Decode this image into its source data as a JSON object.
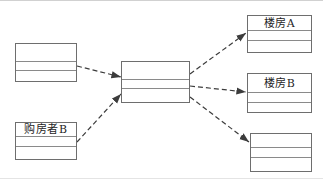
{
  "diagram": {
    "nodes": {
      "left_top": {
        "label": ""
      },
      "left_bottom": {
        "label": "购房者B"
      },
      "middle": {
        "label": ""
      },
      "right_top": {
        "label": "楼房A"
      },
      "right_middle": {
        "label": "楼房B"
      },
      "right_bottom": {
        "label": ""
      }
    },
    "edges": [
      {
        "from": "left_top",
        "to": "middle",
        "style": "dashed-arrow"
      },
      {
        "from": "left_bottom",
        "to": "middle",
        "style": "dashed-arrow"
      },
      {
        "from": "middle",
        "to": "right_top",
        "style": "dashed-arrow"
      },
      {
        "from": "middle",
        "to": "right_middle",
        "style": "dashed-arrow"
      },
      {
        "from": "middle",
        "to": "right_bottom",
        "style": "dashed-arrow"
      }
    ],
    "colors": {
      "background": "#ffffff",
      "box_border": "#6e6e6e",
      "divider": "#8a8a8a",
      "arrow": "#3c3c3c",
      "text": "#1f1f1f"
    }
  }
}
